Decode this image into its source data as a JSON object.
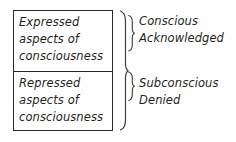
{
  "diagram": {
    "background_color": "#ffffff",
    "line_color": "#2b2b2b",
    "text_color": "#231f20",
    "box": {
      "cells": [
        {
          "id": "expressed",
          "lines": [
            "Expressed",
            "aspects of",
            "consciousness"
          ]
        },
        {
          "id": "repressed",
          "lines": [
            "Repressed",
            "aspects of",
            "consciousness"
          ]
        }
      ]
    },
    "labels": [
      {
        "id": "conscious",
        "lines": [
          "Conscious",
          "Acknowledged"
        ]
      },
      {
        "id": "subconscious",
        "lines": [
          "Subconscious",
          "Denied"
        ]
      }
    ],
    "braces": {
      "outer": "curly-brace-full-height",
      "inner_top": "curly-brace-top-cell",
      "inner_bottom": "curly-brace-bottom-cell"
    }
  }
}
